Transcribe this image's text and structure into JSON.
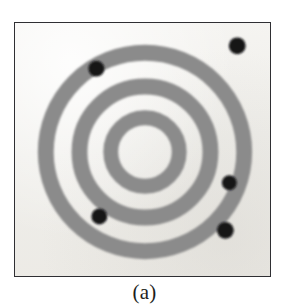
{
  "figure": {
    "caption": "(a)",
    "panel": {
      "border_color": "#2f2f33",
      "background_color": "#f2f1ed",
      "x": 14,
      "y": 22,
      "width": 257,
      "height": 255
    }
  },
  "chart_data": {
    "type": "scatter",
    "title": "(a)",
    "subtitle": "",
    "xlabel": "",
    "ylabel": "",
    "grid": false,
    "legend_position": "none",
    "center": {
      "x": 145,
      "y": 152
    },
    "ring_color": "#8b8b8b",
    "gap_color": "#f2f1ed",
    "marker_color": "#121214",
    "rings": [
      {
        "name": "inner-ring",
        "inner_radius": 27,
        "outer_radius": 42,
        "color": "#8b8b8b"
      },
      {
        "name": "middle-ring",
        "inner_radius": 58,
        "outer_radius": 74,
        "color": "#8b8b8b"
      },
      {
        "name": "outer-ring",
        "inner_radius": 92,
        "outer_radius": 108,
        "color": "#8b8b8b"
      }
    ],
    "markers": [
      {
        "id": "marker-1",
        "x": 238,
        "y": 45,
        "radius": 8.5,
        "color": "#121214",
        "region": "outside-outer-ring"
      },
      {
        "id": "marker-2",
        "x": 96,
        "y": 68,
        "radius": 8.0,
        "color": "#121214",
        "region": "on-outer-ring"
      },
      {
        "id": "marker-3",
        "x": 230,
        "y": 183,
        "radius": 7.5,
        "color": "#121214",
        "region": "on-outer-ring"
      },
      {
        "id": "marker-4",
        "x": 99,
        "y": 217,
        "radius": 8.0,
        "color": "#121214",
        "region": "on-middle-ring"
      },
      {
        "id": "marker-5",
        "x": 226,
        "y": 231,
        "radius": 8.5,
        "color": "#121214",
        "region": "on-outer-ring"
      }
    ],
    "marker_count": 5,
    "ring_count": 3
  }
}
